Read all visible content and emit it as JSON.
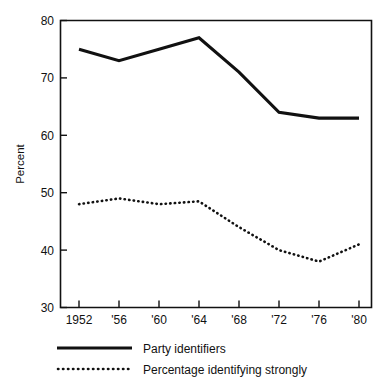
{
  "chart_data": {
    "type": "line",
    "title": "",
    "xlabel": "",
    "ylabel": "Percent",
    "categories": [
      "1952",
      "'56",
      "'60",
      "'64",
      "'68",
      "'72",
      "'76",
      "'80"
    ],
    "x_tick_labels": [
      "1952",
      "'56",
      "'60",
      "'64",
      "'68",
      "'72",
      "'76",
      "'80"
    ],
    "y_tick_labels": [
      "80",
      "70",
      "60",
      "50",
      "40",
      "30"
    ],
    "ylim": [
      30,
      80
    ],
    "y_ticks": [
      30,
      40,
      50,
      60,
      70,
      80
    ],
    "grid": false,
    "legend_position": "below-axes-left",
    "series": [
      {
        "name": "Party identifiers",
        "style": "solid",
        "color": "#111111",
        "values": [
          75,
          73,
          75,
          77,
          71,
          64,
          63,
          63
        ]
      },
      {
        "name": "Percentage identifying strongly",
        "style": "dotted",
        "color": "#111111",
        "values": [
          48,
          49,
          48,
          48.5,
          44,
          40,
          38,
          41
        ]
      }
    ]
  },
  "axes": {
    "y_axis_title": "Percent"
  },
  "legend": {
    "items": [
      {
        "label": "Party identifiers",
        "style": "solid"
      },
      {
        "label": "Percentage identifying strongly",
        "style": "dotted"
      }
    ]
  }
}
